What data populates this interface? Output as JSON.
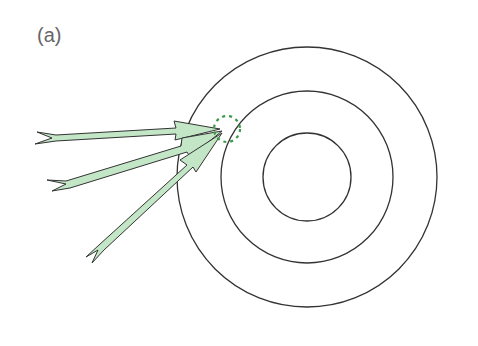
{
  "figure": {
    "label": "(a)",
    "target": {
      "center": [
        307,
        177
      ],
      "rings": [
        {
          "name": "outer",
          "radius": 130
        },
        {
          "name": "middle",
          "radius": 86
        },
        {
          "name": "inner",
          "radius": 44
        }
      ],
      "stroke_color": "#333333"
    },
    "impact_zone": {
      "center": [
        227,
        129
      ],
      "radius": 13,
      "color": "#3a9a4a",
      "style": "dashed"
    },
    "arrows": [
      {
        "name": "arrow-top",
        "from": [
          35,
          137
        ],
        "to": [
          220,
          129
        ]
      },
      {
        "name": "arrow-middle",
        "from": [
          48,
          186
        ],
        "to": [
          222,
          132
        ]
      },
      {
        "name": "arrow-bottom",
        "from": [
          86,
          262
        ],
        "to": [
          222,
          134
        ]
      }
    ],
    "arrow_fill": "#c2e6c6",
    "arrow_stroke": "#333333"
  }
}
